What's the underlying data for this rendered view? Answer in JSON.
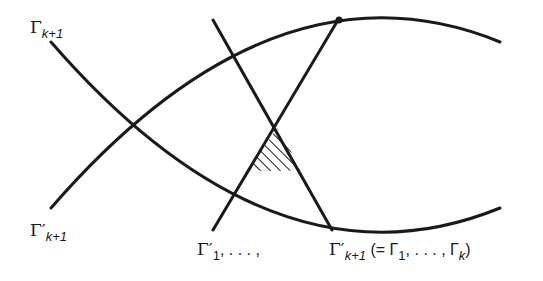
{
  "diagram": {
    "stroke_color": "#1a1a1a",
    "hatch_color": "#1a1a1a",
    "labels": {
      "top_left": {
        "base": "Γ",
        "sub": "k+1"
      },
      "bottom_left": {
        "base": "Γ′",
        "sub": "k+1"
      },
      "bottom_middle": {
        "base": "Γ′",
        "sub": "1",
        "rest": ", . . . ,"
      },
      "bottom_right": {
        "base": "Γ′",
        "sub": "k+1",
        "open": " (= Γ",
        "sub2": "1",
        "mid": ", . . . , Γ",
        "sub3": "k",
        "close": ")"
      }
    }
  }
}
